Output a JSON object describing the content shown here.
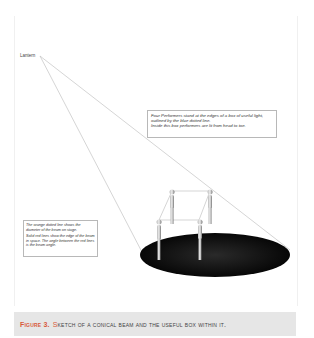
{
  "diagram": {
    "lantern_label": "Lantern",
    "note": {
      "lines": [
        "Four Performers stand at the edges of a box of useful light,",
        "outlined by the blue dotted line.",
        "Inside this box performers are lit from head to toe."
      ]
    },
    "legend": {
      "paragraph1": "The orange dotted line shows the diameter of the beam on stage.",
      "paragraph2": "Solid red lines show the edge of the beam in space. The angle between the red lines is the beam angle."
    },
    "colors": {
      "beam_lines": "#b0b0b0",
      "stage_pool": "#0a0a0a",
      "caption_accent": "#d85a3a",
      "caption_bg": "#e6e6e6"
    },
    "performer_count": 4
  },
  "caption": {
    "figure_label": "Figure 3.",
    "first_letter": "S",
    "text": "ketch of a conical beam and the useful box within it."
  }
}
